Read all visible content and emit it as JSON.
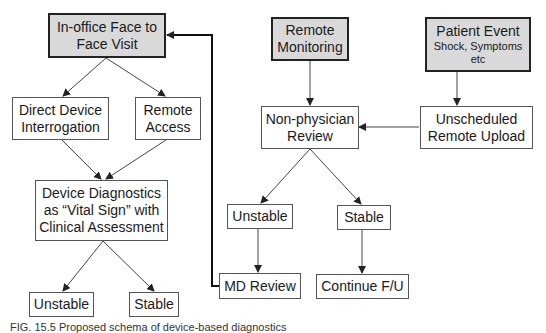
{
  "diagram": {
    "nodes": {
      "in_office": {
        "label": "In-office Face to Face Visit",
        "lines": [
          "In-office Face to",
          "Face Visit"
        ]
      },
      "direct_interrogation": {
        "lines": [
          "Direct Device",
          "Interrogation"
        ]
      },
      "remote_access": {
        "lines": [
          "Remote",
          "Access"
        ]
      },
      "device_diagnostics": {
        "lines": [
          "Device Diagnostics",
          "as “Vital Sign” with",
          "Clinical Assessment"
        ]
      },
      "left_unstable": {
        "label": "Unstable"
      },
      "left_stable": {
        "label": "Stable"
      },
      "remote_monitoring": {
        "lines": [
          "Remote",
          "Monitoring"
        ]
      },
      "patient_event": {
        "title": "Patient Event",
        "sub_lines": [
          "Shock, Symptoms",
          "etc"
        ]
      },
      "non_physician_review": {
        "lines": [
          "Non-physician",
          "Review"
        ]
      },
      "unscheduled_upload": {
        "lines": [
          "Unscheduled",
          "Remote Upload"
        ]
      },
      "right_unstable": {
        "label": "Unstable"
      },
      "right_stable": {
        "label": "Stable"
      },
      "md_review": {
        "label": "MD Review"
      },
      "continue_fu": {
        "label": "Continue F/U"
      }
    },
    "edges": [
      [
        "in_office",
        "direct_interrogation"
      ],
      [
        "in_office",
        "remote_access"
      ],
      [
        "direct_interrogation",
        "device_diagnostics"
      ],
      [
        "remote_access",
        "device_diagnostics"
      ],
      [
        "device_diagnostics",
        "left_unstable"
      ],
      [
        "device_diagnostics",
        "left_stable"
      ],
      [
        "remote_monitoring",
        "non_physician_review"
      ],
      [
        "patient_event",
        "unscheduled_upload"
      ],
      [
        "unscheduled_upload",
        "non_physician_review"
      ],
      [
        "non_physician_review",
        "right_unstable"
      ],
      [
        "non_physician_review",
        "right_stable"
      ],
      [
        "right_unstable",
        "md_review"
      ],
      [
        "right_stable",
        "continue_fu"
      ],
      [
        "md_review",
        "in_office"
      ]
    ],
    "colors": {
      "start_fill": "#d9d9d9",
      "border": "#555555",
      "line": "#333333"
    }
  },
  "caption": "FIG. 15.5 Proposed schema of device-based diagnostics"
}
